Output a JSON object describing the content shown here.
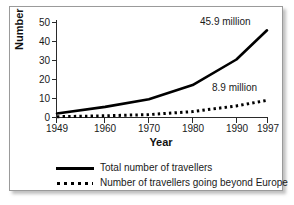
{
  "chart_data": {
    "type": "line",
    "title": "",
    "xlabel": "Year",
    "ylabel": "Number",
    "xlim": [
      1949,
      1997
    ],
    "ylim": [
      0,
      50
    ],
    "xticks": [
      "1949",
      "1960",
      "1970",
      "1980",
      "1990",
      "1997"
    ],
    "yticks": [
      "0",
      "10",
      "20",
      "30",
      "40",
      "50"
    ],
    "grid": false,
    "legend_position": "below",
    "annotations": [
      {
        "text": "45.9 million",
        "series": "Total number of travellers",
        "x": 1997,
        "y": 45.9
      },
      {
        "text": "8.9 million",
        "series": "Number of travellers going beyond Europe",
        "x": 1997,
        "y": 8.9
      }
    ],
    "series": [
      {
        "name": "Total number of travellers",
        "style": "solid",
        "color": "#000000",
        "x": [
          1949,
          1960,
          1970,
          1980,
          1990,
          1997
        ],
        "values": [
          2.0,
          5.5,
          9.5,
          17.0,
          30.5,
          45.9
        ]
      },
      {
        "name": "Number of travellers going beyond Europe",
        "style": "dotted",
        "color": "#000000",
        "x": [
          1949,
          1960,
          1970,
          1980,
          1990,
          1997
        ],
        "values": [
          0.3,
          0.8,
          1.4,
          3.0,
          6.0,
          8.9
        ]
      }
    ]
  },
  "axes": {
    "y_title": "Number",
    "x_title": "Year",
    "y_tick_labels": [
      "50",
      "40",
      "30",
      "20",
      "10",
      "0"
    ],
    "x_tick_labels": [
      "1949",
      "1960",
      "1970",
      "1980",
      "1990",
      "1997"
    ]
  },
  "annotations": {
    "total_label": "45.9 million",
    "beyond_label": "8.9 million"
  },
  "legend": {
    "items": [
      {
        "label": "Total number of travellers",
        "style": "solid"
      },
      {
        "label": "Number of travellers going beyond Europe",
        "style": "dotted"
      }
    ]
  },
  "colors": {
    "line": "#000000",
    "text": "#1a1a1a",
    "frame_border": "#9a9a9a",
    "background": "#ffffff"
  }
}
